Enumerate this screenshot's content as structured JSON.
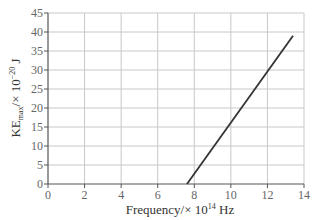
{
  "chart_data": {
    "type": "line",
    "title": "",
    "xlabel": "Frequency/× 10^14 Hz",
    "ylabel": "KE_max/× 10^-20 J",
    "xlim": [
      0,
      14
    ],
    "ylim": [
      0,
      45
    ],
    "xticks": [
      0,
      2,
      4,
      6,
      8,
      10,
      12,
      14
    ],
    "yticks": [
      0,
      5,
      10,
      15,
      20,
      25,
      30,
      35,
      40,
      45
    ],
    "grid": true,
    "legend": null,
    "series": [
      {
        "name": "KE_max vs frequency",
        "x": [
          7.6,
          13.4
        ],
        "y": [
          0,
          39
        ],
        "color": "#333333"
      }
    ]
  },
  "labels": {
    "x_main": "Frequency/× 10",
    "x_exp": "14",
    "x_unit": " Hz",
    "y_main": "KE",
    "y_sub": "max",
    "y_mid": "/× 10",
    "y_exp": "−20",
    "y_unit": " J"
  }
}
